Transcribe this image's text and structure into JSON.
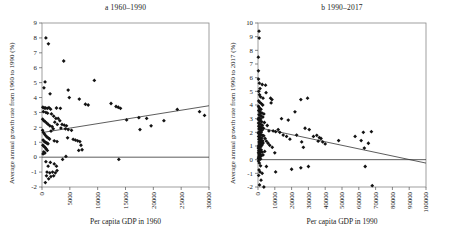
{
  "page": {
    "background": "#ffffff",
    "ink_color": "#1a1a1a",
    "frame_color": "#888888"
  },
  "chart_data": [
    {
      "type": "scatter",
      "title": "a 1960–1990",
      "xlabel": "Per capita GDP in 1960",
      "ylabel": "Average annual growth rate from 1960 to 1990 (%)",
      "xlim": [
        0,
        30000
      ],
      "ylim": [
        -2,
        9
      ],
      "xticks": [
        0,
        5000,
        10000,
        15000,
        20000,
        25000,
        30000
      ],
      "yticks": [
        -2,
        -1,
        0,
        1,
        2,
        3,
        4,
        5,
        6,
        7,
        8,
        9
      ],
      "grid": false,
      "legend": "none",
      "marker": "diamond",
      "point_color": "#131313",
      "zero_line": true,
      "trendline": {
        "x": [
          0,
          30000
        ],
        "y": [
          1.65,
          3.45
        ]
      },
      "points": [
        [
          700,
          8.0
        ],
        [
          1150,
          7.6
        ],
        [
          3900,
          6.45
        ],
        [
          550,
          5.05
        ],
        [
          9400,
          5.15
        ],
        [
          350,
          4.65
        ],
        [
          4700,
          4.5
        ],
        [
          1450,
          4.25
        ],
        [
          4900,
          4.0
        ],
        [
          6700,
          3.9
        ],
        [
          7800,
          3.55
        ],
        [
          8300,
          3.5
        ],
        [
          150,
          3.35
        ],
        [
          400,
          3.3
        ],
        [
          650,
          3.3
        ],
        [
          950,
          3.28
        ],
        [
          1250,
          3.32
        ],
        [
          1550,
          3.22
        ],
        [
          2600,
          3.3
        ],
        [
          3300,
          3.28
        ],
        [
          250,
          3.05
        ],
        [
          700,
          3.0
        ],
        [
          1000,
          2.95
        ],
        [
          1700,
          2.9
        ],
        [
          2100,
          2.75
        ],
        [
          2500,
          2.6
        ],
        [
          2900,
          2.6
        ],
        [
          3200,
          2.45
        ],
        [
          2300,
          2.35
        ],
        [
          2750,
          2.2
        ],
        [
          3600,
          2.2
        ],
        [
          4000,
          2.15
        ],
        [
          4400,
          2.1
        ],
        [
          3400,
          1.95
        ],
        [
          4200,
          1.9
        ],
        [
          4700,
          1.85
        ],
        [
          5300,
          1.8
        ],
        [
          120,
          2.55
        ],
        [
          320,
          2.45
        ],
        [
          520,
          2.4
        ],
        [
          820,
          2.3
        ],
        [
          1120,
          2.2
        ],
        [
          1420,
          2.1
        ],
        [
          1820,
          2.05
        ],
        [
          2020,
          1.9
        ],
        [
          1620,
          1.75
        ],
        [
          100,
          1.8
        ],
        [
          250,
          1.65
        ],
        [
          450,
          1.55
        ],
        [
          650,
          1.45
        ],
        [
          900,
          1.35
        ],
        [
          1150,
          1.28
        ],
        [
          1350,
          1.22
        ],
        [
          200,
          1.15
        ],
        [
          420,
          1.05
        ],
        [
          620,
          1.0
        ],
        [
          870,
          0.95
        ],
        [
          1070,
          0.9
        ],
        [
          160,
          0.8
        ],
        [
          360,
          0.72
        ],
        [
          560,
          0.65
        ],
        [
          760,
          0.55
        ],
        [
          960,
          0.45
        ],
        [
          310,
          0.35
        ],
        [
          510,
          0.28
        ],
        [
          190,
          0.22
        ],
        [
          2200,
          1.1
        ],
        [
          2700,
          1.05
        ],
        [
          4600,
          1.3
        ],
        [
          5600,
          1.2
        ],
        [
          6000,
          1.15
        ],
        [
          6400,
          1.1
        ],
        [
          6800,
          1.05
        ],
        [
          7000,
          0.8
        ],
        [
          7200,
          0.5
        ],
        [
          6600,
          0.45
        ],
        [
          4300,
          0.05
        ],
        [
          12400,
          3.6
        ],
        [
          13300,
          3.4
        ],
        [
          13700,
          3.35
        ],
        [
          14100,
          3.28
        ],
        [
          15200,
          2.5
        ],
        [
          17400,
          2.65
        ],
        [
          18800,
          2.6
        ],
        [
          17600,
          1.85
        ],
        [
          19600,
          2.1
        ],
        [
          21900,
          2.45
        ],
        [
          24300,
          3.2
        ],
        [
          28300,
          3.05
        ],
        [
          29200,
          2.8
        ],
        [
          700,
          -0.3
        ],
        [
          1500,
          -0.35
        ],
        [
          2200,
          -0.45
        ],
        [
          1100,
          -0.6
        ],
        [
          2600,
          -0.6
        ],
        [
          900,
          -1.0
        ],
        [
          1400,
          -1.05
        ],
        [
          1900,
          -1.0
        ],
        [
          2400,
          -1.05
        ],
        [
          800,
          -1.25
        ],
        [
          1600,
          -1.3
        ],
        [
          2100,
          -1.25
        ],
        [
          1200,
          -1.45
        ],
        [
          2700,
          -0.9
        ],
        [
          600,
          -1.7
        ],
        [
          3700,
          -0.15
        ],
        [
          13800,
          -0.15
        ]
      ]
    },
    {
      "type": "scatter",
      "title": "b 1990–2017",
      "xlabel": "Per capita GDP in 1990",
      "ylabel": "Average annual growth rate from 1990 to 2017 (%)",
      "xlim": [
        0,
        100000
      ],
      "ylim": [
        -2,
        10
      ],
      "xticks": [
        0,
        10000,
        20000,
        30000,
        40000,
        50000,
        60000,
        70000,
        80000,
        90000,
        100000
      ],
      "yticks": [
        -2,
        -1,
        0,
        1,
        2,
        3,
        4,
        5,
        6,
        7,
        8,
        9,
        10
      ],
      "grid": false,
      "legend": "none",
      "marker": "diamond",
      "point_color": "#131313",
      "zero_line": true,
      "trendline": {
        "x": [
          0,
          100000
        ],
        "y": [
          2.35,
          -0.25
        ]
      },
      "points": [
        [
          600,
          9.4
        ],
        [
          700,
          8.9
        ],
        [
          200,
          7.5
        ],
        [
          250,
          6.5
        ],
        [
          300,
          5.9
        ],
        [
          800,
          5.6
        ],
        [
          2500,
          5.5
        ],
        [
          4500,
          5.45
        ],
        [
          1200,
          5.2
        ],
        [
          500,
          5.0
        ],
        [
          4800,
          4.9
        ],
        [
          900,
          4.75
        ],
        [
          1500,
          4.6
        ],
        [
          3000,
          4.5
        ],
        [
          7500,
          4.5
        ],
        [
          8300,
          4.4
        ],
        [
          25500,
          4.4
        ],
        [
          29500,
          4.5
        ],
        [
          400,
          4.3
        ],
        [
          1000,
          4.2
        ],
        [
          2000,
          4.1
        ],
        [
          2800,
          4.0
        ],
        [
          7800,
          4.15
        ],
        [
          300,
          3.9
        ],
        [
          700,
          3.8
        ],
        [
          1200,
          3.72
        ],
        [
          1800,
          3.68
        ],
        [
          450,
          3.6
        ],
        [
          900,
          3.5
        ],
        [
          1500,
          3.45
        ],
        [
          2400,
          3.4
        ],
        [
          3500,
          3.35
        ],
        [
          600,
          3.3
        ],
        [
          1100,
          3.25
        ],
        [
          2000,
          3.18
        ],
        [
          2900,
          3.12
        ],
        [
          22000,
          3.5
        ],
        [
          500,
          3.05
        ],
        [
          1000,
          3.0
        ],
        [
          1600,
          2.98
        ],
        [
          14000,
          3.0
        ],
        [
          18000,
          2.9
        ],
        [
          200,
          2.95
        ],
        [
          800,
          2.88
        ],
        [
          1300,
          2.82
        ],
        [
          2200,
          2.78
        ],
        [
          3800,
          2.72
        ],
        [
          350,
          2.68
        ],
        [
          900,
          2.62
        ],
        [
          1700,
          2.58
        ],
        [
          2600,
          2.52
        ],
        [
          5500,
          2.5
        ],
        [
          450,
          2.45
        ],
        [
          1100,
          2.4
        ],
        [
          2000,
          2.35
        ],
        [
          3200,
          2.3
        ],
        [
          600,
          2.25
        ],
        [
          1400,
          2.2
        ],
        [
          2400,
          2.15
        ],
        [
          6500,
          2.1
        ],
        [
          750,
          2.05
        ],
        [
          1900,
          2.0
        ],
        [
          9000,
          2.1
        ],
        [
          10500,
          2.05
        ],
        [
          12000,
          2.2
        ],
        [
          28000,
          2.3
        ],
        [
          30500,
          2.2
        ],
        [
          13000,
          2.0
        ],
        [
          62700,
          2.0
        ],
        [
          67500,
          2.05
        ],
        [
          250,
          1.95
        ],
        [
          700,
          1.9
        ],
        [
          1200,
          1.85
        ],
        [
          1800,
          1.8
        ],
        [
          2600,
          1.78
        ],
        [
          3400,
          1.75
        ],
        [
          400,
          1.7
        ],
        [
          900,
          1.65
        ],
        [
          1500,
          1.6
        ],
        [
          2200,
          1.58
        ],
        [
          4200,
          1.55
        ],
        [
          550,
          1.5
        ],
        [
          1100,
          1.45
        ],
        [
          1900,
          1.4
        ],
        [
          2800,
          1.38
        ],
        [
          5000,
          1.35
        ],
        [
          650,
          1.3
        ],
        [
          1300,
          1.28
        ],
        [
          2100,
          1.25
        ],
        [
          3000,
          1.22
        ],
        [
          6000,
          1.2
        ],
        [
          800,
          1.15
        ],
        [
          1600,
          1.1
        ],
        [
          2400,
          1.08
        ],
        [
          7000,
          1.05
        ],
        [
          350,
          1.0
        ],
        [
          950,
          0.98
        ],
        [
          1700,
          0.95
        ],
        [
          8500,
          0.9
        ],
        [
          15000,
          1.8
        ],
        [
          17000,
          1.7
        ],
        [
          19000,
          1.5
        ],
        [
          23000,
          1.8
        ],
        [
          26000,
          1.3
        ],
        [
          33000,
          1.7
        ],
        [
          35000,
          1.78
        ],
        [
          36500,
          1.62
        ],
        [
          37500,
          1.55
        ],
        [
          35800,
          1.35
        ],
        [
          38500,
          1.3
        ],
        [
          40000,
          1.15
        ],
        [
          48000,
          1.4
        ],
        [
          57800,
          1.7
        ],
        [
          61400,
          1.4
        ],
        [
          65700,
          1.2
        ],
        [
          63300,
          0.85
        ],
        [
          27000,
          0.9
        ],
        [
          200,
          0.85
        ],
        [
          600,
          0.8
        ],
        [
          1100,
          0.75
        ],
        [
          1900,
          0.72
        ],
        [
          450,
          0.65
        ],
        [
          1000,
          0.6
        ],
        [
          1600,
          0.58
        ],
        [
          2500,
          0.55
        ],
        [
          300,
          0.5
        ],
        [
          800,
          0.45
        ],
        [
          1400,
          0.4
        ],
        [
          550,
          0.35
        ],
        [
          1200,
          0.3
        ],
        [
          2000,
          0.28
        ],
        [
          400,
          0.2
        ],
        [
          900,
          0.15
        ],
        [
          250,
          0.1
        ],
        [
          700,
          0.05
        ],
        [
          1500,
          0.05
        ],
        [
          3000,
          0.35
        ],
        [
          4000,
          0.6
        ],
        [
          10000,
          0.5
        ],
        [
          300,
          -0.1
        ],
        [
          800,
          -0.25
        ],
        [
          1500,
          -0.45
        ],
        [
          600,
          -0.75
        ],
        [
          1200,
          -0.9
        ],
        [
          2500,
          -1.0
        ],
        [
          400,
          -1.15
        ],
        [
          5000,
          -0.5
        ],
        [
          10500,
          -0.9
        ],
        [
          20000,
          -0.7
        ],
        [
          30000,
          -0.5
        ],
        [
          3500,
          -2.0
        ],
        [
          68000,
          -1.9
        ],
        [
          900,
          -1.85
        ],
        [
          1800,
          -1.5
        ],
        [
          63800,
          -0.5
        ],
        [
          25500,
          -0.6
        ]
      ]
    }
  ]
}
